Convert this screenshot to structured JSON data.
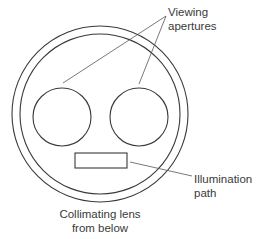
{
  "diagram": {
    "title": "Collimating lens from below",
    "labels": {
      "viewing_apertures": [
        "Viewing",
        "apertures"
      ],
      "illumination_path": [
        "Illumination",
        "path"
      ],
      "caption": [
        "Collimating lens",
        "from below"
      ]
    },
    "components": [
      {
        "id": "outer-ring",
        "type": "circle"
      },
      {
        "id": "inner-ring",
        "type": "circle"
      },
      {
        "id": "left-aperture",
        "type": "circle"
      },
      {
        "id": "right-aperture",
        "type": "circle"
      },
      {
        "id": "illumination-slot",
        "type": "rectangle"
      }
    ],
    "colors": {
      "stroke": "#3a3a3a",
      "background": "#ffffff"
    }
  }
}
